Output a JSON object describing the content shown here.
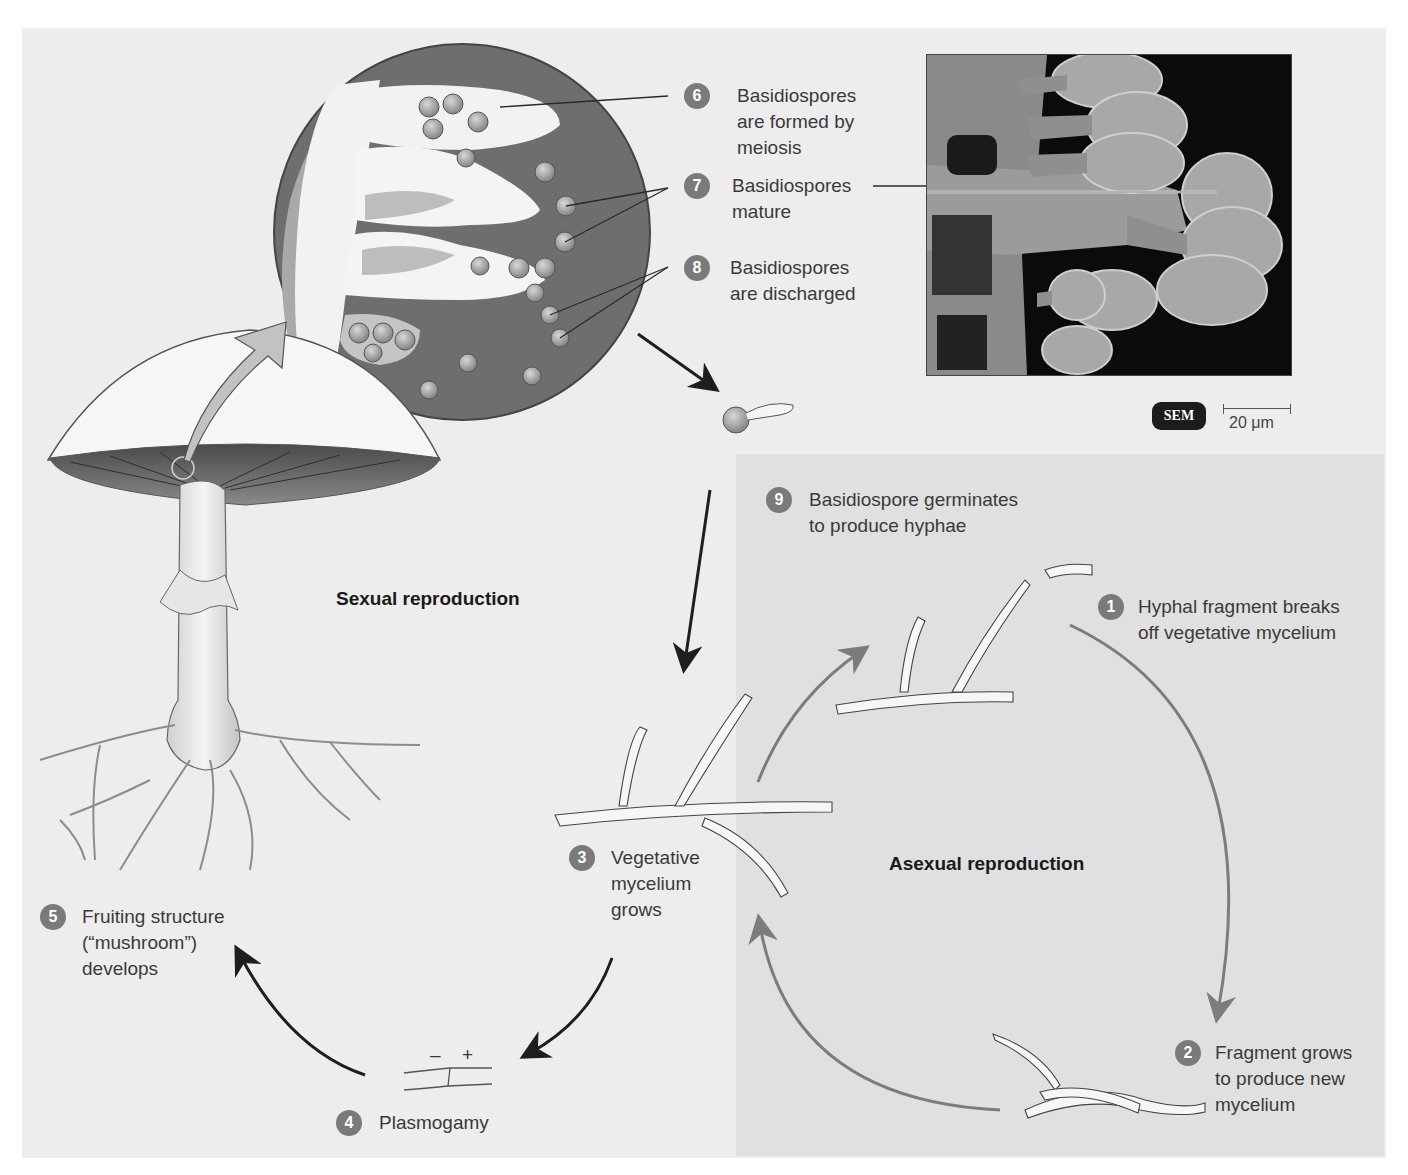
{
  "figure": {
    "sections": {
      "sexual": "Sexual reproduction",
      "asexual": "Asexual reproduction"
    },
    "steps": [
      {
        "num": "1",
        "text": "Hyphal fragment breaks\noff vegetative mycelium"
      },
      {
        "num": "2",
        "text": "Fragment grows\nto produce new\nmycelium"
      },
      {
        "num": "3",
        "text": "Vegetative\nmycelium\ngrows"
      },
      {
        "num": "4",
        "text": "Plasmogamy"
      },
      {
        "num": "5",
        "text": "Fruiting structure\n(“mushroom”)\ndevelops"
      },
      {
        "num": "6",
        "text": "Basidiospores\nare formed by\nmeiosis"
      },
      {
        "num": "7",
        "text": "Basidiospores\nmature"
      },
      {
        "num": "8",
        "text": "Basidiospores\nare discharged"
      },
      {
        "num": "9",
        "text": "Basidiospore germinates\nto produce hyphae"
      }
    ],
    "micrograph": {
      "type_badge": "SEM",
      "scale_bar": "20 μm"
    },
    "plasmogamy_signs": {
      "minus": "–",
      "plus": "+"
    },
    "colors": {
      "background": "#ededed",
      "asexual_panel": "#e0e0e0",
      "badge": "#7a7a7a",
      "arrow_dark": "#1e1e1e",
      "arrow_gray": "#7c7c7c",
      "gill_dark": "#555555",
      "circle_fill": "#6e6e6e"
    }
  }
}
